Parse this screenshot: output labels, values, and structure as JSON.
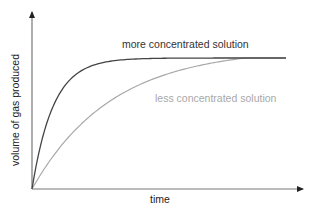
{
  "chart_data": {
    "type": "line",
    "title": "",
    "xlabel": "time",
    "ylabel": "volume of gas produced",
    "grid": false,
    "legend": "inline labels",
    "axis_ticks": "none",
    "xlim": [
      0,
      1
    ],
    "ylim": [
      0,
      1
    ],
    "series": [
      {
        "name": "more concentrated solution",
        "color": "#444444",
        "description": "rises steeply from origin, levels off early at maximum volume",
        "x": [
          0,
          0.05,
          0.1,
          0.15,
          0.2,
          0.3,
          0.4,
          0.5,
          0.7,
          1.0
        ],
        "y": [
          0,
          0.45,
          0.7,
          0.84,
          0.91,
          0.97,
          0.99,
          1.0,
          1.0,
          1.0
        ]
      },
      {
        "name": "less concentrated solution",
        "color": "#a8a8a8",
        "description": "rises gradually from origin, reaches same final volume later",
        "x": [
          0,
          0.1,
          0.2,
          0.3,
          0.4,
          0.5,
          0.6,
          0.7,
          0.8,
          1.0
        ],
        "y": [
          0,
          0.22,
          0.42,
          0.58,
          0.71,
          0.81,
          0.89,
          0.95,
          0.99,
          1.0
        ]
      }
    ]
  },
  "labels": {
    "more": "more concentrated solution",
    "less": "less concentrated solution",
    "x_axis": "time",
    "y_axis": "volume of gas produced"
  }
}
